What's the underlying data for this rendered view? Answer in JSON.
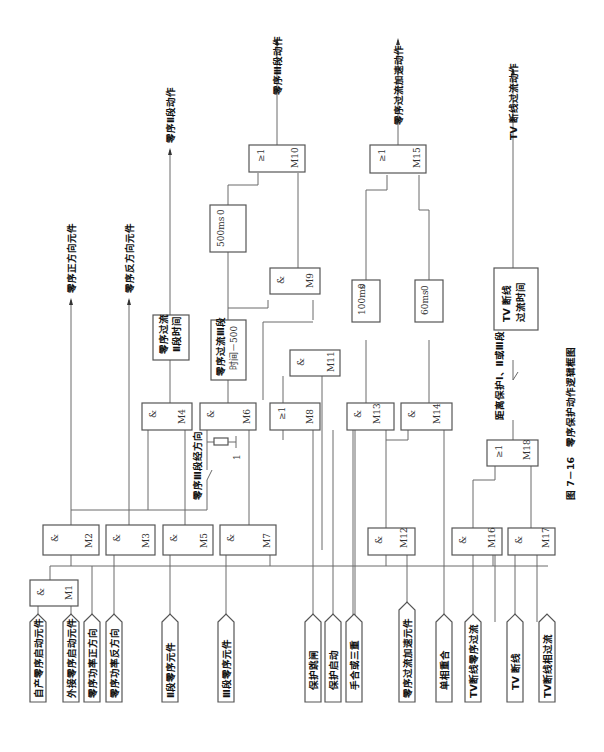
{
  "figure": {
    "caption": "图 7－16　零序保护动作逻辑框图"
  },
  "inputs": [
    {
      "id": "in1",
      "label": "自产零序启动元件"
    },
    {
      "id": "in2",
      "label": "外接零序启动元件"
    },
    {
      "id": "in3",
      "label": "零序功率正方向"
    },
    {
      "id": "in4",
      "label": "零序功率反方向"
    },
    {
      "id": "in5",
      "label": "Ⅱ段零序元件"
    },
    {
      "id": "in6",
      "label": "Ⅲ段零序元件"
    },
    {
      "id": "in7",
      "label": "保护跳闸"
    },
    {
      "id": "in8",
      "label": "保护启动"
    },
    {
      "id": "in9",
      "label": "手合或三重"
    },
    {
      "id": "in10",
      "label": "零序过流加速元件"
    },
    {
      "id": "in11",
      "label": "单相重合"
    },
    {
      "id": "in12",
      "label": "TV断线零序过流"
    },
    {
      "id": "in13",
      "label": "TV 断线"
    },
    {
      "id": "in14",
      "label": "TV断线相过流"
    }
  ],
  "gates": [
    {
      "id": "M1",
      "sym": "&",
      "name": "M1"
    },
    {
      "id": "M2",
      "sym": "&",
      "name": "M2"
    },
    {
      "id": "M3",
      "sym": "&",
      "name": "M3"
    },
    {
      "id": "M4",
      "sym": "&",
      "name": "M4"
    },
    {
      "id": "M5",
      "sym": "&",
      "name": "M5"
    },
    {
      "id": "M6",
      "sym": "&",
      "name": "M6"
    },
    {
      "id": "M7",
      "sym": "&",
      "name": "M7"
    },
    {
      "id": "M8",
      "sym": "≥1",
      "name": "M8"
    },
    {
      "id": "M9",
      "sym": "&",
      "name": "M9"
    },
    {
      "id": "M10",
      "sym": "≥1",
      "name": "M10"
    },
    {
      "id": "M11",
      "sym": "&",
      "name": "M11"
    },
    {
      "id": "M12",
      "sym": "&",
      "name": "M12"
    },
    {
      "id": "M13",
      "sym": "&",
      "name": "M13"
    },
    {
      "id": "M14",
      "sym": "&",
      "name": "M14"
    },
    {
      "id": "M15",
      "sym": "≥1",
      "name": "M15"
    },
    {
      "id": "M16",
      "sym": "&",
      "name": "M16"
    },
    {
      "id": "M17",
      "sym": "&",
      "name": "M17"
    },
    {
      "id": "M18",
      "sym": "≥1",
      "name": "M18"
    }
  ],
  "timers": [
    {
      "id": "T1",
      "line1": "零序过流",
      "line2": "Ⅱ段时间"
    },
    {
      "id": "T2",
      "line1": "零序过流Ⅲ段",
      "line2": "时间－500"
    },
    {
      "id": "T3",
      "line1": "500ms",
      "line2": "0"
    },
    {
      "id": "T4",
      "line1": "100ms",
      "line2": "0"
    },
    {
      "id": "T5",
      "line1": "60ms",
      "line2": "0"
    },
    {
      "id": "T6",
      "line1": "TV 断线",
      "line2": "过流时间"
    }
  ],
  "outputs": [
    {
      "id": "out1",
      "label": "零序正方向元件"
    },
    {
      "id": "out2",
      "label": "零序反方向元件"
    },
    {
      "id": "out3",
      "label": "零序Ⅱ段动作"
    },
    {
      "id": "out4",
      "label": "零序Ⅲ段动作"
    },
    {
      "id": "out5",
      "label": "零序过流加速动作"
    },
    {
      "id": "out6",
      "label": "TV 断线过流动作"
    }
  ],
  "switches": [
    {
      "id": "sw1",
      "label": "零序Ⅲ段经方向"
    },
    {
      "id": "sw2",
      "label": "距离保护Ⅰ、Ⅱ或Ⅲ段"
    }
  ],
  "constants": {
    "one": "1"
  }
}
